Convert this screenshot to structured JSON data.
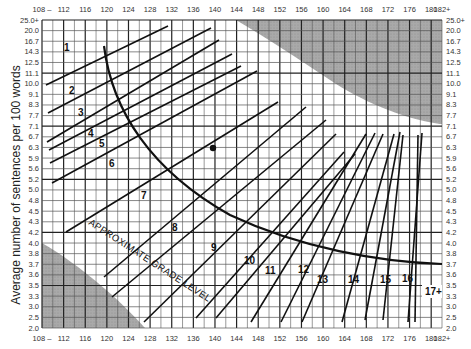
{
  "chart_data": {
    "type": "line",
    "xlabel": "Average number of syllables per 100 words",
    "ylabel": "Average number of sentences per 100 words",
    "x_ticks": [
      "108 –",
      "112",
      "116",
      "120",
      "124",
      "128",
      "132",
      "136",
      "140",
      "144",
      "148",
      "152",
      "156",
      "160",
      "164",
      "168",
      "172",
      "176",
      "180",
      "182+"
    ],
    "y_ticks": [
      "25.0+",
      "20.0",
      "16.7",
      "14.3",
      "12.5",
      "11.1",
      "10.0",
      "9.1",
      "8.3",
      "7.7",
      "7.1",
      "6.7",
      "6.3",
      "5.9",
      "5.6",
      "5.2",
      "5.0",
      "4.8",
      "4.5",
      "4.3",
      "4.2",
      "4.0",
      "3.8",
      "3.7",
      "3.6",
      "3.5",
      "3.3",
      "3.0",
      "2.5",
      "2.0"
    ],
    "xlim": [
      108,
      182
    ],
    "grid": true,
    "grade_labels": [
      "1",
      "2",
      "3",
      "4",
      "5",
      "6",
      "7",
      "8",
      "9",
      "10",
      "11",
      "12",
      "13",
      "14",
      "15",
      "16",
      "17+"
    ],
    "curve_label": "APPROXIMATE GRADE LEVEL",
    "sample_point": {
      "syllables": 141,
      "sentences": 6.3
    },
    "shaded_regions": [
      "upper-right invalid region",
      "lower-left invalid region"
    ]
  },
  "axis": {
    "y_title": "Average number of sentences per 100 words",
    "curve_label": "APPROXIMATE GRADE LEVEL"
  }
}
